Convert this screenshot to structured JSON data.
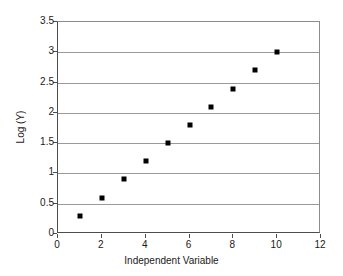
{
  "chart_data": {
    "type": "scatter",
    "title": "",
    "xlabel": "Independent Variable",
    "ylabel": "Log (Y)",
    "x": [
      1,
      2,
      3,
      4,
      5,
      6,
      7,
      8,
      9,
      10
    ],
    "values": [
      0.3,
      0.6,
      0.9,
      1.2,
      1.5,
      1.8,
      2.1,
      2.4,
      2.7,
      3.0
    ],
    "series": [
      {
        "name": "Log (Y)",
        "marker": "square",
        "marker_color": "#000000",
        "points": [
          {
            "x": 1,
            "y": 0.3
          },
          {
            "x": 2,
            "y": 0.6
          },
          {
            "x": 3,
            "y": 0.9
          },
          {
            "x": 4,
            "y": 1.2
          },
          {
            "x": 5,
            "y": 1.5
          },
          {
            "x": 6,
            "y": 1.8
          },
          {
            "x": 7,
            "y": 2.1
          },
          {
            "x": 8,
            "y": 2.4
          },
          {
            "x": 9,
            "y": 2.7
          },
          {
            "x": 10,
            "y": 3.0
          }
        ]
      }
    ],
    "xlim": [
      0,
      12
    ],
    "ylim": [
      0,
      3.5
    ],
    "xticks": [
      0,
      2,
      4,
      6,
      8,
      10,
      12
    ],
    "xtick_labels": [
      "0",
      "2",
      "4",
      "6",
      "8",
      "10",
      "12"
    ],
    "yticks": [
      0,
      0.5,
      1,
      1.5,
      2,
      2.5,
      3,
      3.5
    ],
    "ytick_labels": [
      "0",
      "0.5",
      "1",
      "1.5",
      "2",
      "2.5",
      "3",
      "3.5"
    ],
    "grid": "horizontal",
    "gridline_color": "#9a9a9a",
    "legend": "none",
    "plot_background": "#ffffff",
    "axis_color": "#4d4d4d"
  }
}
